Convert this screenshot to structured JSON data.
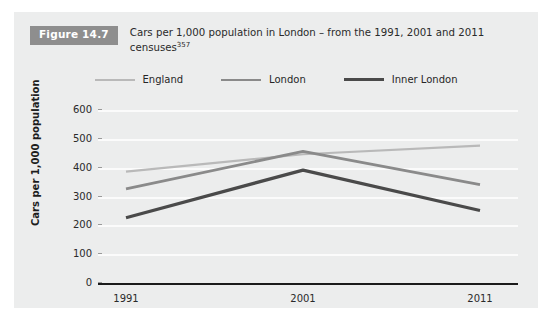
{
  "figure": {
    "badge_label": "Figure 14.7",
    "caption_main": "Cars per 1,000 population in London – from the 1991, 2001 and 2011 censuses",
    "caption_superscript": "357",
    "panel_color": "#eceded",
    "badge_color": "#8e8e8e"
  },
  "legend": {
    "position": "top-center",
    "items": [
      {
        "label": "England",
        "color": "#b9b9b9",
        "width_px": 2.2
      },
      {
        "label": "London",
        "color": "#8a8a8a",
        "width_px": 2.8
      },
      {
        "label": "Inner London",
        "color": "#4a4a4a",
        "width_px": 3.2
      }
    ]
  },
  "axes": {
    "y_title": "Cars per 1,000 population",
    "y_ticks": [
      "600",
      "500",
      "400",
      "300",
      "200",
      "100",
      "0"
    ],
    "x_ticks": [
      "1991",
      "2001",
      "2011"
    ]
  },
  "chart_data": {
    "type": "line",
    "title": "Cars per 1,000 population in London – from the 1991, 2001 and 2011 censuses",
    "xlabel": "",
    "ylabel": "Cars per 1,000 population",
    "x": [
      "1991",
      "2001",
      "2011"
    ],
    "categories": [
      "1991",
      "2001",
      "2011"
    ],
    "ylim": [
      0,
      600
    ],
    "yticks": [
      0,
      100,
      200,
      300,
      400,
      500,
      600
    ],
    "grid": true,
    "legend_position": "top-center",
    "series": [
      {
        "name": "England",
        "color": "#b9b9b9",
        "values": [
          390,
          450,
          480
        ]
      },
      {
        "name": "London",
        "color": "#8a8a8a",
        "values": [
          330,
          460,
          345
        ]
      },
      {
        "name": "Inner London",
        "color": "#4a4a4a",
        "values": [
          230,
          395,
          255
        ]
      }
    ]
  }
}
